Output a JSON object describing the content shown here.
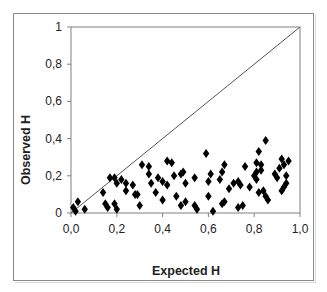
{
  "chart_data": {
    "type": "scatter",
    "title": "",
    "xlabel": "Expected H",
    "ylabel": "Observed H",
    "xlim": [
      0,
      1
    ],
    "ylim": [
      0,
      1
    ],
    "x_ticks": [
      "0,0",
      "0,2",
      "0,4",
      "0,6",
      "0,8",
      "1,0"
    ],
    "y_ticks": [
      "0",
      "0,2",
      "0,4",
      "0,6",
      "0,8",
      "1"
    ],
    "grid": false,
    "legend": null,
    "reference_line": {
      "label": "y = x",
      "from": [
        0,
        0
      ],
      "to": [
        1,
        1
      ]
    },
    "marker": "diamond",
    "marker_color": "#000000",
    "series": [
      {
        "name": "loci",
        "points": [
          [
            0.01,
            0.03
          ],
          [
            0.02,
            0.01
          ],
          [
            0.03,
            0.06
          ],
          [
            0.06,
            0.02
          ],
          [
            0.14,
            0.11
          ],
          [
            0.15,
            0.05
          ],
          [
            0.16,
            0.03
          ],
          [
            0.17,
            0.19
          ],
          [
            0.19,
            0.19
          ],
          [
            0.19,
            0.05
          ],
          [
            0.2,
            0.16
          ],
          [
            0.2,
            0.02
          ],
          [
            0.22,
            0.18
          ],
          [
            0.24,
            0.12
          ],
          [
            0.24,
            0.16
          ],
          [
            0.27,
            0.15
          ],
          [
            0.28,
            0.1
          ],
          [
            0.29,
            0.1
          ],
          [
            0.3,
            0.04
          ],
          [
            0.31,
            0.26
          ],
          [
            0.34,
            0.25
          ],
          [
            0.34,
            0.21
          ],
          [
            0.35,
            0.16
          ],
          [
            0.37,
            0.11
          ],
          [
            0.38,
            0.19
          ],
          [
            0.4,
            0.17
          ],
          [
            0.4,
            0.07
          ],
          [
            0.42,
            0.15
          ],
          [
            0.42,
            0.28
          ],
          [
            0.44,
            0.27
          ],
          [
            0.45,
            0.2
          ],
          [
            0.46,
            0.09
          ],
          [
            0.48,
            0.21
          ],
          [
            0.48,
            0.04
          ],
          [
            0.49,
            0.22
          ],
          [
            0.5,
            0.16
          ],
          [
            0.5,
            0.06
          ],
          [
            0.54,
            0.04
          ],
          [
            0.55,
            0.02
          ],
          [
            0.54,
            0.19
          ],
          [
            0.59,
            0.32
          ],
          [
            0.6,
            0.17
          ],
          [
            0.61,
            0.21
          ],
          [
            0.6,
            0.09
          ],
          [
            0.62,
            0.01
          ],
          [
            0.65,
            0.18
          ],
          [
            0.66,
            0.22
          ],
          [
            0.67,
            0.26
          ],
          [
            0.66,
            0.05
          ],
          [
            0.67,
            0.06
          ],
          [
            0.69,
            0.13
          ],
          [
            0.71,
            0.16
          ],
          [
            0.73,
            0.17
          ],
          [
            0.73,
            0.03
          ],
          [
            0.75,
            0.04
          ],
          [
            0.74,
            0.15
          ],
          [
            0.76,
            0.25
          ],
          [
            0.78,
            0.14
          ],
          [
            0.8,
            0.2
          ],
          [
            0.82,
            0.33
          ],
          [
            0.81,
            0.27
          ],
          [
            0.83,
            0.26
          ],
          [
            0.83,
            0.23
          ],
          [
            0.81,
            0.22
          ],
          [
            0.81,
            0.18
          ],
          [
            0.82,
            0.11
          ],
          [
            0.84,
            0.12
          ],
          [
            0.85,
            0.09
          ],
          [
            0.86,
            0.07
          ],
          [
            0.89,
            0.21
          ],
          [
            0.9,
            0.19
          ],
          [
            0.91,
            0.24
          ],
          [
            0.92,
            0.29
          ],
          [
            0.93,
            0.26
          ],
          [
            0.92,
            0.12
          ],
          [
            0.93,
            0.14
          ],
          [
            0.94,
            0.16
          ],
          [
            0.94,
            0.2
          ],
          [
            0.95,
            0.28
          ],
          [
            0.85,
            0.39
          ]
        ]
      }
    ]
  },
  "layout": {
    "plot": {
      "left": 71,
      "top": 27,
      "right": 300,
      "bottom": 213
    },
    "frame_color": "#8a8a8a",
    "axis_color": "#808080",
    "line_color": "#555555"
  }
}
